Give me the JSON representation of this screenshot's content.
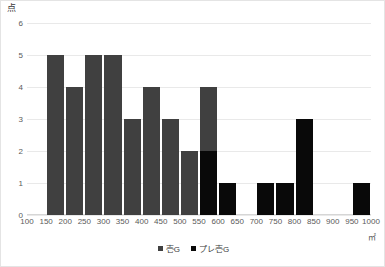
{
  "chart_data": {
    "type": "bar",
    "title": "",
    "subtitle": "",
    "xlabel": "㎡",
    "ylabel": "点",
    "grid": "horizontal",
    "legend_position": "bottom",
    "ylim": [
      0,
      6
    ],
    "ytick_step": 1,
    "ytick_labels": [
      "0",
      "1",
      "2",
      "3",
      "4",
      "5",
      "6"
    ],
    "xlim": [
      100,
      1000
    ],
    "xtick_step": 50,
    "xtick_labels": [
      "100",
      "150",
      "200",
      "250",
      "300",
      "350",
      "400",
      "450",
      "500",
      "550",
      "600",
      "650",
      "700",
      "750",
      "800",
      "850",
      "900",
      "950",
      "1000"
    ],
    "bin_edges": [
      100,
      150,
      200,
      250,
      300,
      350,
      400,
      450,
      500,
      550,
      600,
      650,
      700,
      750,
      800,
      850,
      900,
      950,
      1000
    ],
    "bin_labels": [
      "100-150",
      "150-200",
      "200-250",
      "250-300",
      "300-350",
      "350-400",
      "400-450",
      "450-500",
      "500-550",
      "550-600",
      "600-650",
      "650-700",
      "700-750",
      "750-800",
      "800-850",
      "850-900",
      "900-950",
      "950-1000"
    ],
    "series": [
      {
        "name": "壱G",
        "color": "#404040",
        "values": [
          0,
          5,
          4,
          5,
          5,
          3,
          4,
          3,
          2,
          4,
          0,
          0,
          0,
          0,
          0,
          0,
          0,
          0
        ]
      },
      {
        "name": "プレ壱G",
        "color": "#090909",
        "values": [
          0,
          0,
          0,
          0,
          0,
          0,
          0,
          0,
          0,
          2,
          1,
          0,
          1,
          1,
          3,
          0,
          0,
          1
        ]
      }
    ]
  },
  "colors": {
    "series_a": "#404040",
    "series_b": "#090909",
    "gridline": "#e9e9e9",
    "border": "#e4e4e4",
    "axis_text": "#5a5a5a",
    "background": "#ffffff"
  }
}
